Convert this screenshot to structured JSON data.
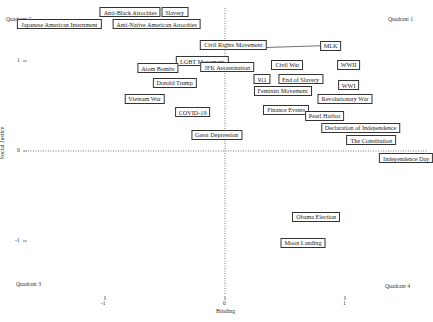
{
  "chart_data": {
    "type": "scatter",
    "title": "",
    "xlabel": "Binding",
    "ylabel": "Social Justice",
    "xticks": [
      "-1",
      "0",
      "1"
    ],
    "yticks": [
      "1",
      "0",
      "-1"
    ],
    "xlim": [
      -1.9,
      1.7
    ],
    "ylim": [
      -1.7,
      1.7
    ],
    "grid": false,
    "reference_lines": {
      "x": 0,
      "y": 0,
      "style": "dotted"
    },
    "quadrant_labels": [
      "Quadrant 1",
      "Quadrant 2",
      "Quadrant 3",
      "Quadrant 4"
    ],
    "points": [
      {
        "label": "Anti-Black Atrocities",
        "x": -0.79,
        "y": 1.54
      },
      {
        "label": "Slavery",
        "x": -0.42,
        "y": 1.54
      },
      {
        "label": "Japanese American Internment",
        "x": -1.38,
        "y": 1.41
      },
      {
        "label": "Anti-Native American Atrocities",
        "x": -0.57,
        "y": 1.41
      },
      {
        "label": "Civil Rights Movement",
        "x": 0.07,
        "y": 1.18
      },
      {
        "label": "MLK",
        "x": 0.88,
        "y": 1.17
      },
      {
        "label": "LGBT Movement",
        "x": -0.19,
        "y": 1.0
      },
      {
        "label": "Atom Bombs",
        "x": -0.56,
        "y": 0.92
      },
      {
        "label": "JFK Assassination",
        "x": 0.02,
        "y": 0.93
      },
      {
        "label": "Civil War",
        "x": 0.52,
        "y": 0.96
      },
      {
        "label": "WWII",
        "x": 1.03,
        "y": 0.96
      },
      {
        "label": "Donald Trump",
        "x": -0.42,
        "y": 0.76
      },
      {
        "label": "911",
        "x": 0.31,
        "y": 0.8
      },
      {
        "label": "End of Slavery",
        "x": 0.63,
        "y": 0.8
      },
      {
        "label": "WWI",
        "x": 1.03,
        "y": 0.73
      },
      {
        "label": "Feminist Movement",
        "x": 0.48,
        "y": 0.67
      },
      {
        "label": "Revolutionary War",
        "x": 1.0,
        "y": 0.58
      },
      {
        "label": "Vietnam War",
        "x": -0.67,
        "y": 0.58
      },
      {
        "label": "COVID-19",
        "x": -0.27,
        "y": 0.43
      },
      {
        "label": "Finance Events",
        "x": 0.51,
        "y": 0.46
      },
      {
        "label": "Pearl Harbor",
        "x": 0.83,
        "y": 0.39
      },
      {
        "label": "Declaration of Independence",
        "x": 1.13,
        "y": 0.26
      },
      {
        "label": "Great Depression",
        "x": -0.07,
        "y": 0.18
      },
      {
        "label": "The Constitution",
        "x": 1.22,
        "y": 0.12
      },
      {
        "label": "Independence Day",
        "x": 1.51,
        "y": -0.08
      },
      {
        "label": "Obama Election",
        "x": 0.76,
        "y": -0.73
      },
      {
        "label": "Moon Landing",
        "x": 0.65,
        "y": -1.02
      }
    ],
    "connectors": [
      {
        "from": "Civil Rights Movement",
        "to": "MLK"
      },
      {
        "from": "LGBT Movement",
        "to": "JFK Assassination"
      },
      {
        "from": "911",
        "to": "End of Slavery"
      }
    ]
  },
  "layout": {
    "origin_px": {
      "x": 225,
      "y": 151
    },
    "unit_px": {
      "x": 120,
      "y": 90
    }
  }
}
